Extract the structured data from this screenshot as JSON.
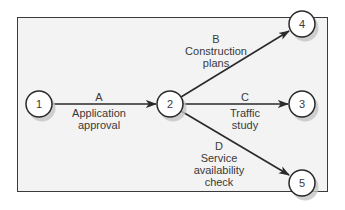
{
  "diagram": {
    "type": "activity-on-arrow network",
    "colors": {
      "background": "#ffffff",
      "frame_fill": "#f3f3f3",
      "stroke": "#2a2a2a",
      "node_fill": "#ffffff",
      "shadow": "#bdbdbd",
      "text": "#3a3a3a"
    },
    "nodes": [
      {
        "id": "1",
        "label": "1"
      },
      {
        "id": "2",
        "label": "2"
      },
      {
        "id": "3",
        "label": "3"
      },
      {
        "id": "4",
        "label": "4"
      },
      {
        "id": "5",
        "label": "5"
      }
    ],
    "edges": [
      {
        "from": "1",
        "to": "2",
        "letter": "A",
        "line1": "Application",
        "line2": "approval",
        "line3": ""
      },
      {
        "from": "2",
        "to": "4",
        "letter": "B",
        "line1": "Construction",
        "line2": "plans",
        "line3": ""
      },
      {
        "from": "2",
        "to": "3",
        "letter": "C",
        "line1": "Traffic",
        "line2": "study",
        "line3": ""
      },
      {
        "from": "2",
        "to": "5",
        "letter": "D",
        "line1": "Service",
        "line2": "availability",
        "line3": "check"
      }
    ]
  }
}
